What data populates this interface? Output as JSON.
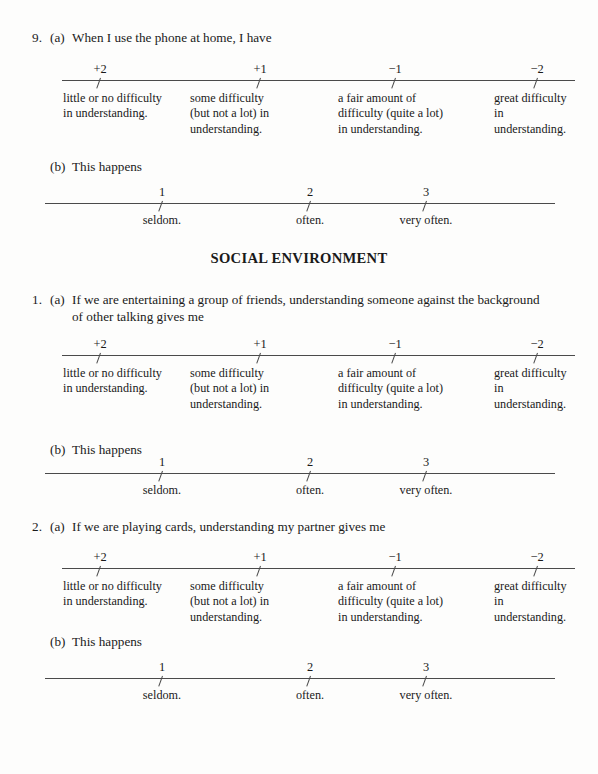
{
  "document": {
    "section_heading": "SOCIAL ENVIRONMENT"
  },
  "difficulty_scale": {
    "ticks": [
      "+2",
      "+1",
      "−1",
      "−2"
    ],
    "labels": [
      "little or no difficulty\nin understanding.",
      "some difficulty\n(but not a lot) in\nunderstanding.",
      "a fair amount of\ndifficulty (quite a lot)\nin understanding.",
      "great difficulty in\nunderstanding."
    ]
  },
  "frequency_scale": {
    "ticks": [
      "1",
      "2",
      "3"
    ],
    "labels": [
      "seldom.",
      "often.",
      "very often."
    ]
  },
  "questions": [
    {
      "number": "9.",
      "part_a_letter": "(a)",
      "part_a_text": "When I use the phone at home, I have",
      "part_a_text_line2": "",
      "part_b_letter": "(b)",
      "part_b_text": "This happens"
    },
    {
      "number": "1.",
      "part_a_letter": "(a)",
      "part_a_text": "If we are entertaining a group of friends, understanding someone against the background",
      "part_a_text_line2": "of other talking gives me",
      "part_b_letter": "(b)",
      "part_b_text": "This happens"
    },
    {
      "number": "2.",
      "part_a_letter": "(a)",
      "part_a_text": "If we are playing cards, understanding my partner gives me",
      "part_a_text_line2": "",
      "part_b_letter": "(b)",
      "part_b_text": "This happens"
    }
  ]
}
